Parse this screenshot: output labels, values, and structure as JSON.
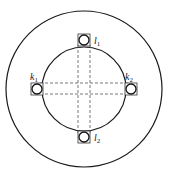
{
  "diagram": {
    "type": "annular-disk-with-sensor-positions",
    "outer_circle": {
      "cx": 84,
      "cy": 89,
      "r": 78
    },
    "inner_circle": {
      "cx": 84,
      "cy": 89,
      "r": 42
    },
    "stroke_color": "#1a1a1a",
    "dash_color": "#555555",
    "sensors": [
      {
        "id": "l1",
        "letter": "l",
        "subscript": "1",
        "x": 84,
        "y": 40,
        "label_x": 96,
        "label_y": 44
      },
      {
        "id": "k1",
        "letter": "k",
        "subscript": "1",
        "x": 37,
        "y": 89,
        "label_x": 31,
        "label_y": 79
      },
      {
        "id": "k2",
        "letter": "k",
        "subscript": "2",
        "x": 131,
        "y": 89,
        "label_x": 126,
        "label_y": 79
      },
      {
        "id": "l2",
        "letter": "l",
        "subscript": "2",
        "x": 84,
        "y": 137,
        "label_x": 96,
        "label_y": 144
      }
    ],
    "dashed_lines": {
      "vertical_x": [
        78,
        90
      ],
      "horizontal_y": [
        83,
        94
      ]
    }
  }
}
